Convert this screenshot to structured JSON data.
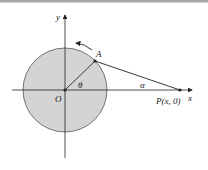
{
  "diagram": {
    "labels": {
      "y_axis": "y",
      "x_axis": "x",
      "origin": "O",
      "point_a": "A",
      "point_p": "P(x, 0)",
      "theta": "θ",
      "alpha": "α"
    },
    "colors": {
      "circle_fill": "#d4d4d4",
      "stroke": "#2a2a2a",
      "background": "#ffffff"
    }
  }
}
